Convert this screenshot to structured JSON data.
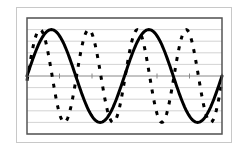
{
  "chart_data": {
    "type": "line",
    "title": "",
    "xlabel": "",
    "ylabel": "",
    "xlim": [
      0,
      6
    ],
    "ylim": [
      -5,
      5
    ],
    "x_ticks": [
      0,
      1,
      2,
      3,
      4,
      5,
      6
    ],
    "y_gridlines": [
      -5,
      -4,
      -3,
      -2,
      -1,
      0,
      1,
      2,
      3,
      4,
      5
    ],
    "grid": true,
    "legend": null,
    "series": [
      {
        "name": "solid",
        "style": "solid",
        "color": "#000000",
        "function": "4*sin(2*pi*x/3)",
        "x": [
          0,
          0.375,
          0.75,
          1.125,
          1.5,
          1.875,
          2.25,
          2.625,
          3,
          3.375,
          3.75,
          4.125,
          4.5,
          4.875,
          5.25,
          5.625,
          6
        ],
        "values": [
          0,
          2.83,
          4,
          2.83,
          0,
          -2.83,
          -4,
          -2.83,
          0,
          2.83,
          4,
          2.83,
          0,
          -2.83,
          -4,
          -2.83,
          0
        ]
      },
      {
        "name": "dashed",
        "style": "dashed",
        "color": "#000000",
        "function": "4*sin(4*pi*x/3 - 0.1)",
        "x": [
          0,
          0.4,
          0.775,
          1.15,
          1.525,
          1.9,
          2.275,
          2.65,
          3.025,
          3.4,
          3.775,
          4.15,
          4.525,
          4.9,
          5.275,
          5.65,
          6
        ],
        "values": [
          -0.4,
          4,
          0,
          -4,
          0,
          4,
          0,
          -4,
          0,
          4,
          0,
          -4,
          0,
          4,
          0,
          -4,
          -0.4
        ]
      }
    ]
  },
  "colors": {
    "frame": "#c8c8c8",
    "plot_border": "#555555",
    "grid": "#c8c8c8",
    "axis": "#888888",
    "line": "#000000"
  }
}
